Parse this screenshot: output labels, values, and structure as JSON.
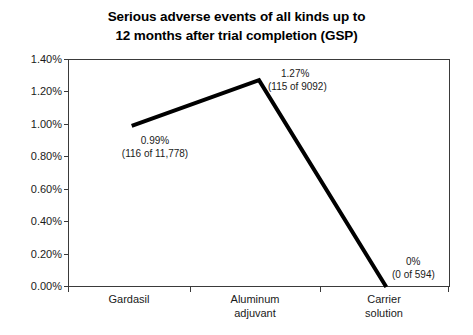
{
  "chart_data": {
    "type": "line",
    "title": "Serious adverse events of all kinds up to 12 months after trial completion (GSP)",
    "title_lines": [
      "Serious adverse events of all kinds up to",
      "12 months after trial completion (GSP)"
    ],
    "xlabel": "",
    "ylabel": "",
    "categories": [
      "Gardasil",
      "Aluminum adjuvant",
      "Carrier solution"
    ],
    "category_lines": [
      [
        "Gardasil"
      ],
      [
        "Aluminum",
        "adjuvant"
      ],
      [
        "Carrier",
        "solution"
      ]
    ],
    "values": [
      0.99,
      1.27,
      0.0
    ],
    "ylim": [
      0.0,
      1.4
    ],
    "ytick_step": 0.2,
    "ytick_labels": [
      "1.40%",
      "1.20%",
      "1.00%",
      "0.80%",
      "0.60%",
      "0.40%",
      "0.20%",
      "0.00%"
    ],
    "ytick_values": [
      1.4,
      1.2,
      1.0,
      0.8,
      0.6,
      0.4,
      0.2,
      0.0
    ],
    "grid": false,
    "legend": false,
    "legend_position": "none",
    "series": [
      {
        "name": "Serious adverse events",
        "values": [
          0.99,
          1.27,
          0.0
        ],
        "color": "#000000",
        "line_width": 4
      }
    ],
    "point_labels": [
      {
        "value": "0.99%",
        "count": "(116 of 11,778)",
        "numerator": 116,
        "denominator": 11778
      },
      {
        "value": "1.27%",
        "count": "(115 of 9092)",
        "numerator": 115,
        "denominator": 9092
      },
      {
        "value": "0%",
        "count": "(0 of 594)",
        "numerator": 0,
        "denominator": 594
      }
    ],
    "colors": {
      "series_line": "#000000",
      "axis": "#3a3a3a",
      "text": "#1a1a1a",
      "background": "#ffffff"
    }
  }
}
